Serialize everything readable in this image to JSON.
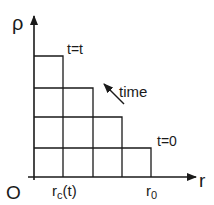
{
  "diagram": {
    "y_axis_label": "ρ",
    "x_axis_label": "r",
    "origin_label": "O",
    "x_tick_rc": "r",
    "x_tick_rc_sub": "c",
    "x_tick_rc_suffix": "(t)",
    "x_tick_r0": "r",
    "x_tick_r0_sub": "0",
    "label_t_t": "t=t",
    "label_t_0": "t=0",
    "label_time": "time",
    "line_color": "#1a1a1a"
  }
}
